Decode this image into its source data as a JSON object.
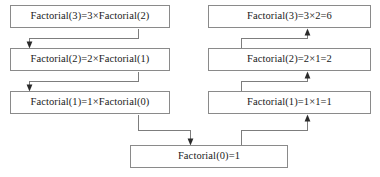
{
  "diagram": {
    "type": "flowchart",
    "colors": {
      "box_border": "#8a8a8a",
      "box_fill": "#ffffff",
      "connector": "#7d7d7d",
      "arrowhead": "#2b2b2b",
      "text": "#1a1a1a",
      "background": "#ffffff"
    },
    "columns": [
      {
        "name": "descent",
        "description": "Recursive calls descending"
      },
      {
        "name": "ascent",
        "description": "Return values ascending"
      }
    ],
    "nodes": [
      {
        "id": "L3",
        "column": "descent",
        "label": "Factorial(3)=3×Factorial(2)",
        "x": 10,
        "y": 5,
        "w": 160,
        "h": 23
      },
      {
        "id": "L2",
        "column": "descent",
        "label": "Factorial(2)=2×Factorial(1)",
        "x": 10,
        "y": 48,
        "w": 160,
        "h": 23
      },
      {
        "id": "L1",
        "column": "descent",
        "label": "Factorial(1)=1×Factorial(0)",
        "x": 10,
        "y": 91,
        "w": 160,
        "h": 23
      },
      {
        "id": "R3",
        "column": "ascent",
        "label": "Factorial(3)=3×2=6",
        "x": 208,
        "y": 5,
        "w": 163,
        "h": 23
      },
      {
        "id": "R2",
        "column": "ascent",
        "label": "Factorial(2)=2×1=2",
        "x": 208,
        "y": 48,
        "w": 163,
        "h": 23
      },
      {
        "id": "R1",
        "column": "ascent",
        "label": "Factorial(1)=1×1=1",
        "x": 208,
        "y": 91,
        "w": 163,
        "h": 23
      },
      {
        "id": "B0",
        "column": "base",
        "label": "Factorial(0)=1",
        "x": 130,
        "y": 145,
        "w": 158,
        "h": 23
      }
    ],
    "edges": [
      {
        "id": "e-L3-L2",
        "from": "L3",
        "to": "L2",
        "direction": "down"
      },
      {
        "id": "e-L2-L1",
        "from": "L2",
        "to": "L1",
        "direction": "down"
      },
      {
        "id": "e-L1-B0",
        "from": "L1",
        "to": "B0",
        "direction": "down"
      },
      {
        "id": "e-B0-R1",
        "from": "B0",
        "to": "R1",
        "direction": "up"
      },
      {
        "id": "e-R1-R2",
        "from": "R1",
        "to": "R2",
        "direction": "up"
      },
      {
        "id": "e-R2-R3",
        "from": "R2",
        "to": "R3",
        "direction": "up"
      }
    ]
  }
}
